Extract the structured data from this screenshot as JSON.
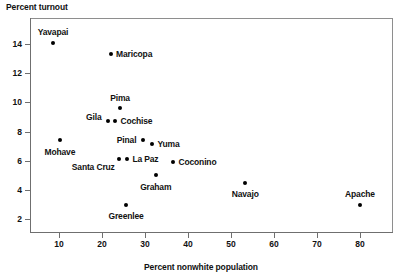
{
  "chart_data": {
    "type": "scatter",
    "title": "",
    "xlabel": "Percent nonwhite population",
    "ylabel": "Percent turnout",
    "xlim": [
      0,
      87
    ],
    "ylim": [
      0,
      15.3
    ],
    "grid": false,
    "legend": "none",
    "xticks": [
      10,
      20,
      30,
      40,
      50,
      60,
      70,
      80
    ],
    "yticks": [
      2,
      4,
      6,
      8,
      10,
      12,
      14
    ],
    "xtick_labels": [
      "10",
      "20",
      "30",
      "40",
      "50",
      "60",
      "70",
      "80"
    ],
    "ytick_labels": [
      "2",
      "4",
      "6",
      "8",
      "10",
      "12",
      "14"
    ],
    "point_color": "#000000",
    "axis_color": "#6f6f6f",
    "points": [
      {
        "label": "Yavapai",
        "x": 8.6,
        "y": 14.1,
        "label_pos": "above"
      },
      {
        "label": "Maricopa",
        "x": 22.0,
        "y": 13.3,
        "label_pos": "right"
      },
      {
        "label": "Pima",
        "x": 24.2,
        "y": 9.6,
        "label_pos": "above"
      },
      {
        "label": "Gila",
        "x": 21.4,
        "y": 8.7,
        "label_pos": "above-left"
      },
      {
        "label": "Cochise",
        "x": 23.0,
        "y": 8.7,
        "label_pos": "right"
      },
      {
        "label": "Mohave",
        "x": 10.2,
        "y": 7.4,
        "label_pos": "below"
      },
      {
        "label": "Pinal",
        "x": 29.5,
        "y": 7.4,
        "label_pos": "left"
      },
      {
        "label": "Yuma",
        "x": 31.6,
        "y": 7.15,
        "label_pos": "right"
      },
      {
        "label": "Santa Cruz",
        "x": 24.0,
        "y": 6.1,
        "label_pos": "below-left"
      },
      {
        "label": "La Paz",
        "x": 25.8,
        "y": 6.1,
        "label_pos": "right"
      },
      {
        "label": "Coconino",
        "x": 36.5,
        "y": 5.9,
        "label_pos": "right"
      },
      {
        "label": "Graham",
        "x": 32.5,
        "y": 5.0,
        "label_pos": "below"
      },
      {
        "label": "Navajo",
        "x": 53.3,
        "y": 4.5,
        "label_pos": "below"
      },
      {
        "label": "Greenlee",
        "x": 25.6,
        "y": 3.0,
        "label_pos": "below"
      },
      {
        "label": "Apache",
        "x": 80.0,
        "y": 3.0,
        "label_pos": "above"
      }
    ]
  }
}
